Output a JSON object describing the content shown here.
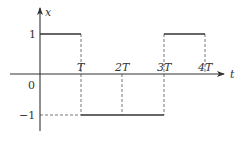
{
  "diagram": {
    "type": "square-wave",
    "axes": {
      "x_label": "t",
      "y_label": "x",
      "origin_label": "0"
    },
    "y_ticks": [
      {
        "value": 1,
        "label": "1"
      },
      {
        "value": -1,
        "label": "−1"
      }
    ],
    "x_ticks": [
      {
        "value": 1,
        "label": "T"
      },
      {
        "value": 2,
        "label": "2T"
      },
      {
        "value": 3,
        "label": "3T"
      },
      {
        "value": 4,
        "label": "4T"
      }
    ],
    "segments": [
      {
        "from": 0,
        "to": 1,
        "level": 1
      },
      {
        "from": 1,
        "to": 3,
        "level": -1
      },
      {
        "from": 3,
        "to": 4,
        "level": 1
      }
    ],
    "colors": {
      "line": "#333333",
      "dashed": "#666666"
    }
  }
}
